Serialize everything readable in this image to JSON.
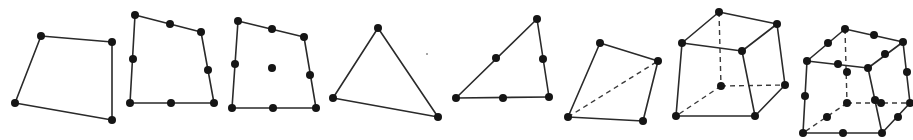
{
  "diagram": {
    "title": "",
    "style": {
      "line_color": "#2a2a2a",
      "node_color": "#151515",
      "node_radius": 4,
      "background": "#ffffff"
    },
    "elements": [
      {
        "id": "quad4",
        "label": "4-node quadrilateral",
        "edges": [
          [
            41,
            36,
            112,
            42
          ],
          [
            112,
            42,
            112,
            120
          ],
          [
            112,
            120,
            15,
            103
          ],
          [
            15,
            103,
            41,
            36
          ]
        ],
        "hidden_edges": [],
        "nodes": [
          [
            41,
            36
          ],
          [
            112,
            42
          ],
          [
            112,
            120
          ],
          [
            15,
            103
          ]
        ]
      },
      {
        "id": "quad8",
        "label": "8-node quadrilateral",
        "edges": [
          [
            135,
            15,
            201,
            32
          ],
          [
            201,
            32,
            214,
            103
          ],
          [
            214,
            103,
            130,
            103
          ],
          [
            130,
            103,
            135,
            15
          ]
        ],
        "hidden_edges": [],
        "nodes": [
          [
            135,
            15
          ],
          [
            170,
            24
          ],
          [
            201,
            32
          ],
          [
            208,
            70
          ],
          [
            214,
            103
          ],
          [
            171,
            103
          ],
          [
            130,
            103
          ],
          [
            133,
            59
          ]
        ]
      },
      {
        "id": "quad9",
        "label": "9-node quadrilateral",
        "edges": [
          [
            238,
            21,
            304,
            37
          ],
          [
            304,
            37,
            316,
            108
          ],
          [
            316,
            108,
            232,
            108
          ],
          [
            232,
            108,
            238,
            21
          ]
        ],
        "hidden_edges": [],
        "nodes": [
          [
            238,
            21
          ],
          [
            272,
            29
          ],
          [
            304,
            37
          ],
          [
            310,
            75
          ],
          [
            316,
            108
          ],
          [
            273,
            108
          ],
          [
            232,
            108
          ],
          [
            235,
            64
          ],
          [
            272,
            68
          ]
        ]
      },
      {
        "id": "tri3",
        "label": "3-node triangle",
        "edges": [
          [
            378,
            28,
            438,
            117
          ],
          [
            438,
            117,
            333,
            98
          ],
          [
            333,
            98,
            378,
            28
          ]
        ],
        "hidden_edges": [],
        "nodes": [
          [
            378,
            28
          ],
          [
            438,
            117
          ],
          [
            333,
            98
          ]
        ]
      },
      {
        "id": "tri6",
        "label": "6-node triangle",
        "edges": [
          [
            537,
            19,
            549,
            97
          ],
          [
            549,
            97,
            456,
            98
          ],
          [
            456,
            98,
            537,
            19
          ]
        ],
        "hidden_edges": [],
        "nodes": [
          [
            537,
            19
          ],
          [
            543,
            59
          ],
          [
            549,
            97
          ],
          [
            503,
            98
          ],
          [
            456,
            98
          ],
          [
            496,
            58
          ]
        ]
      },
      {
        "id": "tet4",
        "label": "4-node tetrahedron",
        "edges": [
          [
            600,
            43,
            658,
            61
          ],
          [
            658,
            61,
            643,
            121
          ],
          [
            643,
            121,
            568,
            117
          ],
          [
            568,
            117,
            600,
            43
          ]
        ],
        "hidden_edges": [
          [
            568,
            117,
            658,
            61
          ]
        ],
        "nodes": [
          [
            600,
            43
          ],
          [
            658,
            61
          ],
          [
            643,
            121
          ],
          [
            568,
            117
          ]
        ]
      },
      {
        "id": "hex8",
        "label": "8-node hexahedron",
        "edges": [
          [
            719,
            12,
            777,
            24
          ],
          [
            777,
            24,
            742,
            51
          ],
          [
            742,
            51,
            682,
            43
          ],
          [
            682,
            43,
            719,
            12
          ],
          [
            682,
            43,
            676,
            116
          ],
          [
            742,
            51,
            755,
            116
          ],
          [
            777,
            24,
            785,
            85
          ],
          [
            676,
            116,
            755,
            116
          ],
          [
            755,
            116,
            785,
            85
          ]
        ],
        "hidden_edges": [
          [
            719,
            12,
            721,
            86
          ],
          [
            721,
            86,
            785,
            85
          ],
          [
            721,
            86,
            676,
            116
          ]
        ],
        "nodes": [
          [
            719,
            12
          ],
          [
            777,
            24
          ],
          [
            742,
            51
          ],
          [
            682,
            43
          ],
          [
            676,
            116
          ],
          [
            755,
            116
          ],
          [
            785,
            85
          ],
          [
            721,
            86
          ]
        ]
      },
      {
        "id": "hex20",
        "label": "20-node hexahedron",
        "edges": [
          [
            845,
            29,
            903,
            42
          ],
          [
            903,
            42,
            868,
            68
          ],
          [
            868,
            68,
            807,
            61
          ],
          [
            807,
            61,
            845,
            29
          ],
          [
            807,
            61,
            803,
            133
          ],
          [
            868,
            68,
            882,
            133
          ],
          [
            903,
            42,
            910,
            103
          ],
          [
            803,
            133,
            882,
            133
          ],
          [
            882,
            133,
            910,
            103
          ]
        ],
        "hidden_edges": [
          [
            845,
            29,
            847,
            103
          ],
          [
            847,
            103,
            910,
            103
          ],
          [
            847,
            103,
            803,
            133
          ]
        ],
        "nodes": [
          [
            845,
            29
          ],
          [
            874,
            35
          ],
          [
            903,
            42
          ],
          [
            885,
            54
          ],
          [
            868,
            68
          ],
          [
            838,
            64
          ],
          [
            807,
            61
          ],
          [
            828,
            43
          ],
          [
            847,
            72
          ],
          [
            907,
            72
          ],
          [
            805,
            96
          ],
          [
            875,
            100
          ],
          [
            847,
            103
          ],
          [
            881,
            103
          ],
          [
            910,
            103
          ],
          [
            898,
            117
          ],
          [
            882,
            133
          ],
          [
            843,
            133
          ],
          [
            803,
            133
          ],
          [
            827,
            117
          ]
        ]
      }
    ],
    "specks": [
      [
        427,
        54
      ]
    ]
  }
}
